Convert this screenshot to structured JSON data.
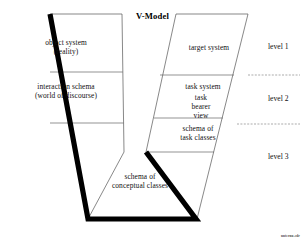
{
  "diagram": {
    "title": "V-Model",
    "credit": "unternu.cdr",
    "left_arm": {
      "labels": [
        {
          "id": "object-system",
          "line1": "object system",
          "line2": "(reality)"
        },
        {
          "id": "interaction-schema",
          "line1": "interaction schema",
          "line2": "(world of discourse)"
        },
        {
          "id": "conceptual-classes",
          "line1": "schema of",
          "line2": "conceptual classes"
        }
      ]
    },
    "right_arm": {
      "labels": [
        {
          "id": "target-system",
          "line1": "target system"
        },
        {
          "id": "task-system",
          "line1": "task system"
        },
        {
          "id": "task-bearer-view",
          "line1": "task",
          "line2": "bearer",
          "line3": "view"
        },
        {
          "id": "schema-task-classes",
          "line1": "schema of",
          "line2": "task classes"
        }
      ]
    },
    "levels": [
      {
        "id": "level-1",
        "label": "level 1"
      },
      {
        "id": "level-2",
        "label": "level 2"
      },
      {
        "id": "level-3",
        "label": "level 3"
      }
    ],
    "colors": {
      "thick_edge": "#000000",
      "thin_outline": "#555555",
      "divider": "#666666",
      "dotted_level_line": "#888888",
      "background": "#ffffff",
      "text": "#111111"
    }
  }
}
